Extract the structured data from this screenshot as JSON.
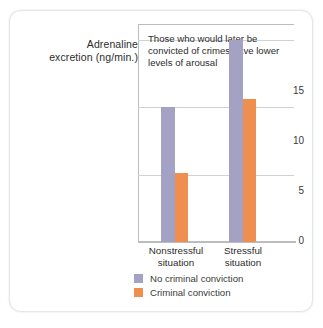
{
  "chart_data": {
    "type": "bar",
    "title": "",
    "annotation": "Those who would later be convicted of crimes have lower levels of arousal",
    "xlabel": "",
    "ylabel": "Adrenaline excretion (ng/min.)",
    "ylabel_lines": [
      "Adrenaline",
      "excretion (ng/min.)"
    ],
    "categories": [
      "Nonstressful situation",
      "Stressful situation"
    ],
    "category_lines": [
      [
        "Nonstressful",
        "situation"
      ],
      [
        "Stressful",
        "situation"
      ]
    ],
    "series": [
      {
        "name": "No criminal conviction",
        "color": "#a3a1c4",
        "values": [
          10.0,
          15.0
        ]
      },
      {
        "name": "Criminal conviction",
        "color": "#ef8f4f",
        "values": [
          5.1,
          10.6
        ]
      }
    ],
    "ylim": [
      0,
      16.2
    ],
    "yticks": [
      0,
      5,
      10,
      15
    ],
    "ytick_labels": [
      "0",
      "5",
      "10",
      "15"
    ],
    "grid": true,
    "legend_position": "bottom-center"
  },
  "legend": {
    "items": [
      {
        "label": "No criminal conviction",
        "color": "#a3a1c4"
      },
      {
        "label": "Criminal conviction",
        "color": "#ef8f4f"
      }
    ]
  },
  "colors": {
    "purple": "#a3a1c4",
    "orange": "#ef8f4f",
    "grid": "#cfd3d3",
    "axis": "#b9bdbd",
    "text": "#2c2c2c",
    "card_border": "#e4e8e8"
  }
}
